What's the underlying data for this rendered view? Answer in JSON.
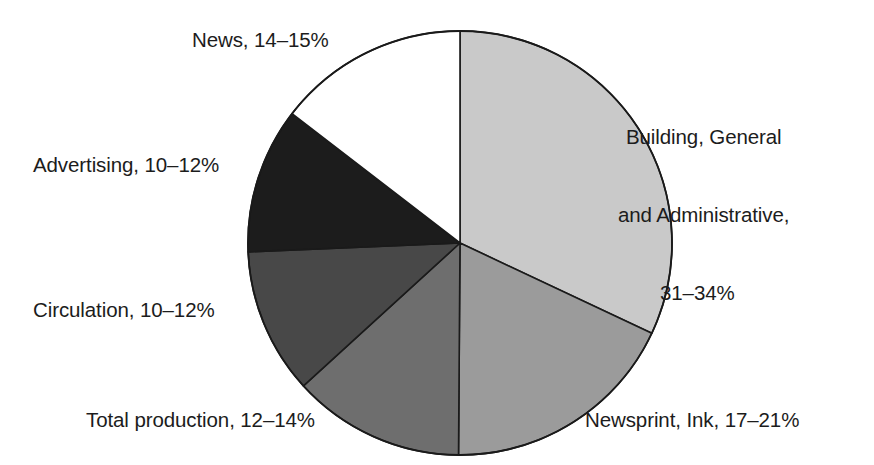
{
  "chart_data": {
    "type": "pie",
    "title": "",
    "subtitle": "",
    "xlabel": "",
    "ylabel": "",
    "legend_position": "none",
    "grid": false,
    "labels_outside": true,
    "center": {
      "x": 460,
      "y": 243
    },
    "radius": 212,
    "start_angle_deg": 0,
    "direction": "clockwise",
    "categories": [
      "Building, General and Administrative",
      "Newsprint, Ink",
      "Total production",
      "Circulation",
      "Advertising",
      "News"
    ],
    "value_ranges": [
      [
        31,
        34
      ],
      [
        17,
        21
      ],
      [
        12,
        14
      ],
      [
        10,
        12
      ],
      [
        10,
        12
      ],
      [
        14,
        15
      ]
    ],
    "values": [
      32.0,
      18.1,
      13.1,
      11.1,
      11.1,
      14.6
    ],
    "range_texts": [
      "31–34%",
      "17–21%",
      "12–14%",
      "10–12%",
      "10–12%",
      "14–15%"
    ],
    "colors": [
      "#c9c9c9",
      "#9b9b9b",
      "#6e6e6e",
      "#484848",
      "#1c1c1c",
      "#ffffff"
    ],
    "stroke_color": "#1a1a1a",
    "sweep_angles_deg": [
      115.2,
      65.2,
      47.2,
      40.0,
      40.0,
      52.4
    ],
    "slices": [
      {
        "name": "Building, General and Administrative",
        "range_text": "31–34%",
        "color": "#c9c9c9",
        "start_deg": 0,
        "sweep_deg": 115.2
      },
      {
        "name": "Newsprint, Ink",
        "range_text": "17–21%",
        "color": "#9b9b9b",
        "start_deg": 115.2,
        "sweep_deg": 65.2
      },
      {
        "name": "Total production",
        "range_text": "12–14%",
        "color": "#6e6e6e",
        "start_deg": 180.4,
        "sweep_deg": 47.2
      },
      {
        "name": "Circulation",
        "range_text": "10–12%",
        "color": "#484848",
        "start_deg": 227.6,
        "sweep_deg": 40.0
      },
      {
        "name": "Advertising",
        "range_text": "10–12%",
        "color": "#1c1c1c",
        "start_deg": 267.6,
        "sweep_deg": 40.0
      },
      {
        "name": "News",
        "range_text": "14–15%",
        "color": "#ffffff",
        "start_deg": 307.6,
        "sweep_deg": 52.4
      }
    ]
  },
  "labels": {
    "news": "News, 14–15%",
    "building_line1": "Building, General",
    "building_line2": "and Administrative,",
    "building_line3": "31–34%",
    "advertising": "Advertising, 10–12%",
    "circulation": "Circulation, 10–12%",
    "total_production": "Total production, 12–14%",
    "newsprint": "Newsprint, Ink, 17–21%"
  }
}
